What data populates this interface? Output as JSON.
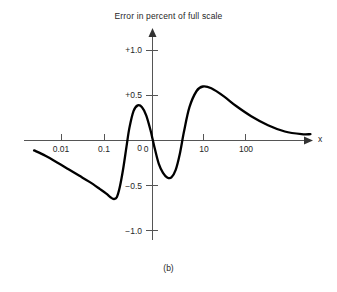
{
  "chart_data": {
    "type": "line",
    "title": "Error in percent of full scale",
    "caption": "(b)",
    "xlabel": "x",
    "ylabel": "",
    "xscale": "log",
    "grid": false,
    "legend": null,
    "xticks": [
      {
        "value": 0.01,
        "label": "0.01"
      },
      {
        "value": 0.1,
        "label": "0.1"
      },
      {
        "value": 1,
        "label": "0"
      },
      {
        "value": 10,
        "label": "10"
      },
      {
        "value": 100,
        "label": "100"
      }
    ],
    "yticks": [
      {
        "value": 1.0,
        "label": "+1.0"
      },
      {
        "value": 0.5,
        "label": "+0.5"
      },
      {
        "value": 0.0,
        "label": "0"
      },
      {
        "value": -0.5,
        "label": "−0.5"
      },
      {
        "value": -1.0,
        "label": "−1.0"
      }
    ],
    "ylim": [
      -1.15,
      1.15
    ],
    "xlim_decades": [
      -2.82,
      3.76
    ],
    "series": [
      {
        "name": "error",
        "color": "#000000",
        "points": [
          {
            "x_decade": -2.82,
            "y": -0.11
          },
          {
            "x_decade": -2.55,
            "y": -0.17
          },
          {
            "x_decade": -2.25,
            "y": -0.25
          },
          {
            "x_decade": -2.0,
            "y": -0.32
          },
          {
            "x_decade": -1.75,
            "y": -0.39
          },
          {
            "x_decade": -1.5,
            "y": -0.46
          },
          {
            "x_decade": -1.25,
            "y": -0.54
          },
          {
            "x_decade": -1.1,
            "y": -0.59
          },
          {
            "x_decade": -1.0,
            "y": -0.63
          },
          {
            "x_decade": -0.92,
            "y": -0.65
          },
          {
            "x_decade": -0.85,
            "y": -0.63
          },
          {
            "x_decade": -0.78,
            "y": -0.52
          },
          {
            "x_decade": -0.7,
            "y": -0.32
          },
          {
            "x_decade": -0.62,
            "y": -0.07
          },
          {
            "x_decade": -0.55,
            "y": 0.14
          },
          {
            "x_decade": -0.45,
            "y": 0.33
          },
          {
            "x_decade": -0.35,
            "y": 0.39
          },
          {
            "x_decade": -0.25,
            "y": 0.37
          },
          {
            "x_decade": -0.15,
            "y": 0.28
          },
          {
            "x_decade": -0.05,
            "y": 0.12
          },
          {
            "x_decade": 0.0,
            "y": 0.02
          },
          {
            "x_decade": 0.06,
            "y": -0.1
          },
          {
            "x_decade": 0.15,
            "y": -0.26
          },
          {
            "x_decade": 0.25,
            "y": -0.36
          },
          {
            "x_decade": 0.35,
            "y": -0.41
          },
          {
            "x_decade": 0.45,
            "y": -0.41
          },
          {
            "x_decade": 0.55,
            "y": -0.33
          },
          {
            "x_decade": 0.65,
            "y": -0.15
          },
          {
            "x_decade": 0.75,
            "y": 0.1
          },
          {
            "x_decade": 0.88,
            "y": 0.37
          },
          {
            "x_decade": 1.05,
            "y": 0.55
          },
          {
            "x_decade": 1.2,
            "y": 0.6
          },
          {
            "x_decade": 1.4,
            "y": 0.58
          },
          {
            "x_decade": 1.7,
            "y": 0.49
          },
          {
            "x_decade": 2.0,
            "y": 0.38
          },
          {
            "x_decade": 2.35,
            "y": 0.27
          },
          {
            "x_decade": 2.75,
            "y": 0.17
          },
          {
            "x_decade": 3.15,
            "y": 0.1
          },
          {
            "x_decade": 3.55,
            "y": 0.07
          },
          {
            "x_decade": 3.76,
            "y": 0.07
          }
        ]
      }
    ],
    "annotations": [
      {
        "name": "left-trough",
        "x_decade": -0.92,
        "y": -0.65
      },
      {
        "name": "first-peak",
        "x_decade": -0.35,
        "y": 0.39
      },
      {
        "name": "mid-trough",
        "x_decade": 0.4,
        "y": -0.41
      },
      {
        "name": "second-peak",
        "x_decade": 1.2,
        "y": 0.6
      }
    ],
    "colors": {
      "curve": "#000000",
      "axis": "#555555",
      "text": "#262626",
      "background": "#ffffff"
    }
  }
}
